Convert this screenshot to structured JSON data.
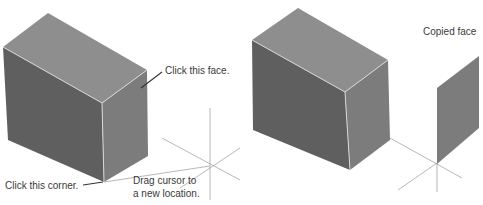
{
  "colors": {
    "top_face": "#8e8e8e",
    "left_face": "#5f5f5f",
    "right_face": "#7c7c7c",
    "edge": "#d8d8d8",
    "guide": "#9a9a9a",
    "leader": "#333333",
    "text": "#3a3a3a"
  },
  "labels": {
    "click_face": "Click this face.",
    "click_corner": "Click this corner.",
    "drag_line1": "Drag cursor to",
    "drag_line2": "a new location.",
    "copied_face": "Copied face"
  }
}
